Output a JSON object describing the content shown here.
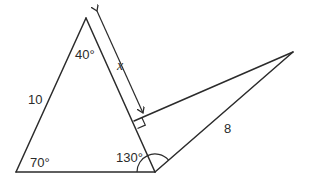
{
  "diagram": {
    "type": "geometry",
    "labels": {
      "apex_angle": "40°",
      "bottom_left_angle": "70°",
      "bottom_right_angle": "130°",
      "left_side": "10",
      "right_side": "8",
      "unknown": "x"
    },
    "points": {
      "apex": [
        86,
        18
      ],
      "bottom_left": [
        16,
        172
      ],
      "bottom_right": [
        155,
        172
      ],
      "far_right": [
        293,
        52
      ],
      "perp_foot": [
        134,
        121
      ]
    },
    "colors": {
      "stroke": "#2b2b2b",
      "background": "#ffffff"
    }
  }
}
